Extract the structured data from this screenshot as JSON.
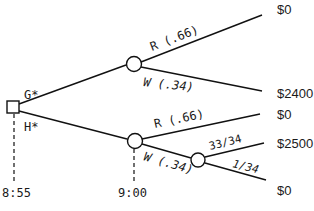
{
  "diagram": {
    "type": "decision-tree",
    "decision_node": {
      "options": [
        "G*",
        "H*"
      ],
      "time": "8:55"
    },
    "chance_node_g": {
      "branches": [
        {
          "label": "R (.66)",
          "payoff": "$0"
        },
        {
          "label": "W (.34)",
          "payoff": "$2400"
        }
      ]
    },
    "chance_node_h": {
      "time": "9:00",
      "branches": [
        {
          "label": "R (.66)",
          "payoff": "$0"
        },
        {
          "label": "W (.34)"
        }
      ]
    },
    "chance_node_h_w": {
      "branches": [
        {
          "label": "33/34",
          "payoff": "$2500"
        },
        {
          "label": "1/34",
          "payoff": "$0"
        }
      ]
    }
  }
}
